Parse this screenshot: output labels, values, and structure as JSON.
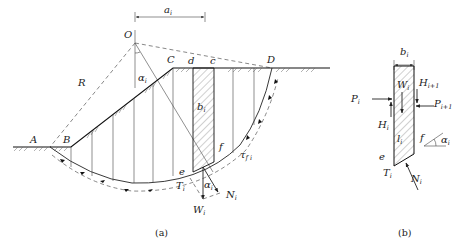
{
  "figure_a": {
    "caption": "(a)",
    "points": {
      "O": "O",
      "A": "A",
      "B": "B",
      "C": "C",
      "D": "D",
      "d": "d",
      "c": "c",
      "e": "e",
      "f": "f"
    },
    "labels": {
      "radius": "R",
      "a_i": "a",
      "a_i_sub": "i",
      "alpha_i": "α",
      "alpha_i_sub": "i",
      "b_i": "b",
      "b_i_sub": "i",
      "T_i": "T",
      "T_i_sub": "i",
      "N_i": "N",
      "N_i_sub": "i",
      "W_i": "W",
      "W_i_sub": "i",
      "tau_fi": "τ",
      "tau_fi_sub": "f i",
      "alpha_i2": "α",
      "alpha_i2_sub": "i"
    }
  },
  "figure_b": {
    "caption": "(b)",
    "labels": {
      "b_i": "b",
      "b_i_sub": "i",
      "W_i": "W",
      "W_i_sub": "i",
      "P_i": "P",
      "P_i_sub": "i",
      "H_i": "H",
      "H_i_sub": "i",
      "H_i1": "H",
      "H_i1_sub": "i+1",
      "P_i1": "P",
      "P_i1_sub": "i+1",
      "l_i": "l",
      "l_i_sub": "i",
      "f": "f",
      "e": "e",
      "alpha_i": "α",
      "alpha_i_sub": "i",
      "T_i": "T",
      "T_i_sub": "i",
      "N_i": "N",
      "N_i_sub": "i"
    }
  }
}
